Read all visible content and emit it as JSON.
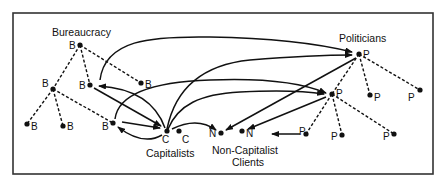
{
  "groups": {
    "bureaucracy": "Bureaucracy",
    "politicians": "Politicians",
    "capitalists": "Capitalists",
    "non_capitalist_line1": "Non-Capitalist",
    "non_capitalist_line2": "Clients"
  },
  "node_labels": {
    "b": "B",
    "c": "C",
    "n": "N",
    "p": "P"
  },
  "colors": {
    "ink": "#111111",
    "frame": "#333333",
    "background": "#ffffff"
  }
}
